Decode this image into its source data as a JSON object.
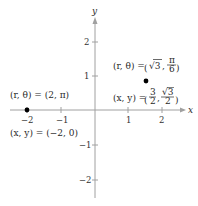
{
  "axes": {
    "x_label": "x",
    "y_label": "y",
    "x_ticks": [
      {
        "value": -2,
        "label": "−2"
      },
      {
        "value": -1,
        "label": "−1"
      },
      {
        "value": 1,
        "label": "1"
      },
      {
        "value": 2,
        "label": "2"
      }
    ],
    "y_ticks": [
      {
        "value": 2,
        "label": "2"
      },
      {
        "value": 1,
        "label": "1"
      },
      {
        "value": -1,
        "label": "−1"
      },
      {
        "value": -2,
        "label": "−2"
      }
    ],
    "color": "#9a9a9a"
  },
  "points": [
    {
      "name": "point-a",
      "x": -2,
      "y": 0,
      "polar_label": "(r, θ) = (2, π)",
      "rect_label": "(x, y) = (−2, 0)"
    },
    {
      "name": "point-b",
      "x": 1.5,
      "y": 0.866,
      "polar_label_prefix": "(r, θ) = ",
      "polar_r": "√3",
      "polar_theta_num": "π",
      "polar_theta_den": "6",
      "rect_label_prefix": "(x, y) = ",
      "rect_x_num": "3",
      "rect_x_den": "2",
      "rect_y_num": "√3",
      "rect_y_den": "2"
    }
  ],
  "point_color": "#000000"
}
